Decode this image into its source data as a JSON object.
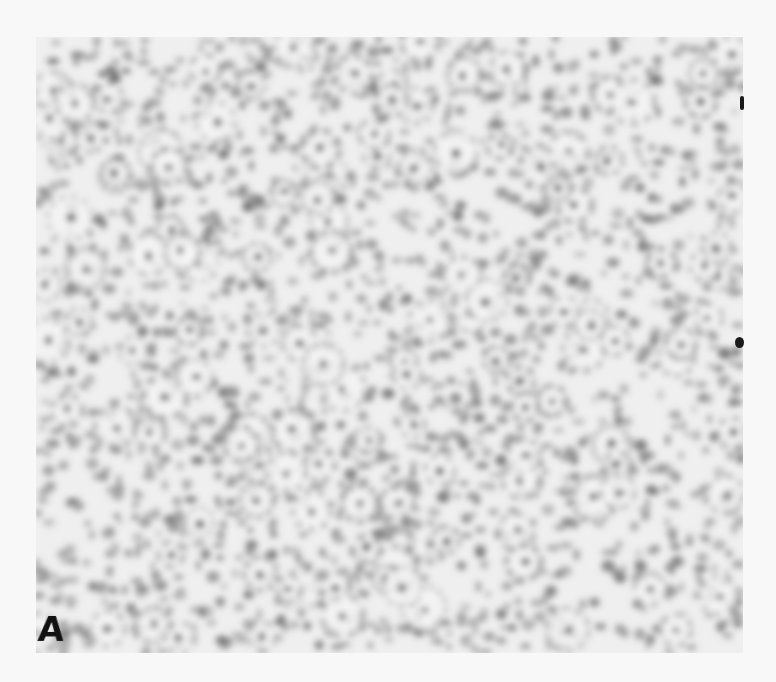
{
  "figure": {
    "panel_label": "A",
    "colors": {
      "background": "#f8f8f8",
      "field": "#eeeeee",
      "blob_dark": "#6e6e6e",
      "blob_mid": "#959595",
      "label": "#111111"
    }
  }
}
